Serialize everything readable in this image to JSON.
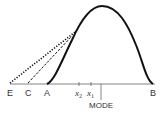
{
  "diagram": {
    "labels": {
      "E": "E",
      "C": "C",
      "A": "A",
      "x2": "x",
      "x2_sub": "2",
      "x1": "x",
      "x1_sub": "1",
      "mode": "MODE",
      "B": "B"
    },
    "lines": {
      "curve": "solid",
      "tangent_from_E": "dotted",
      "tangent_from_C": "dashed"
    },
    "colors": {
      "stroke": "#111111",
      "axis": "#555555",
      "text": "#333333"
    }
  }
}
